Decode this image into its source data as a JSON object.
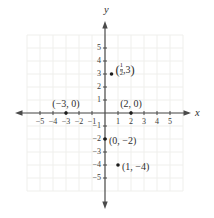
{
  "figure": {
    "background": "#ffffff",
    "axis_color": "#4a4a4a",
    "grid_color": "#efefec",
    "text_color": "#2f2f2f",
    "point_color": "#1c1c1c"
  },
  "chart_data": {
    "type": "scatter",
    "title": "",
    "xlabel": "x",
    "ylabel": "y",
    "xlim": [
      -6,
      6
    ],
    "ylim": [
      -6,
      6
    ],
    "grid": true,
    "legend": "none",
    "x_ticks": [
      -5,
      -4,
      -3,
      -2,
      -1,
      1,
      2,
      3,
      4,
      5
    ],
    "y_ticks": [
      5,
      4,
      3,
      2,
      1,
      -1,
      -2,
      -3,
      -4,
      -5
    ],
    "points": [
      {
        "x": 0.5,
        "y": 3,
        "label": "(1/2, 3)",
        "label_display": {
          "kind": "fraction",
          "pre": "(",
          "num": "1",
          "den": "2",
          "mid": ",3",
          "close": ")"
        },
        "label_placement": "right-up"
      },
      {
        "x": -3,
        "y": 0,
        "label": "(-3, 0)",
        "label_display": {
          "kind": "text",
          "text": "(−3, 0)"
        },
        "label_placement": "above"
      },
      {
        "x": 2,
        "y": 0,
        "label": "(2, 0)",
        "label_display": {
          "kind": "text",
          "text": "(2, 0)"
        },
        "label_placement": "above"
      },
      {
        "x": 0,
        "y": -2,
        "label": "(0, -2)",
        "label_display": {
          "kind": "text",
          "text": "(0, −2)"
        },
        "label_placement": "right"
      },
      {
        "x": 1,
        "y": -4,
        "label": "(1, -4)",
        "label_display": {
          "kind": "text",
          "text": "(1, −4)"
        },
        "label_placement": "right"
      }
    ]
  }
}
